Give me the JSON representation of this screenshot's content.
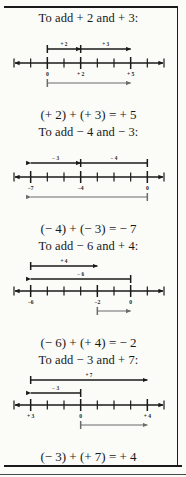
{
  "page": {
    "background_color": "#fbfbf8",
    "ink_color": "#1a1a1a",
    "result_arrow_color": "#6b6b6b"
  },
  "sections": [
    {
      "id": "add-plus2-plus3",
      "heading": "To add + 2 and + 3:",
      "equation": "(+ 2) + (+ 3) = + 5",
      "first_term_label": "+ 2",
      "second_term_label": "+ 3",
      "tick_labels": [
        "0",
        "+ 2",
        "+ 5"
      ],
      "tick_label_positions": [
        0,
        2,
        5
      ],
      "axis_min": -2,
      "axis_max": 7,
      "first_arrow": {
        "from": 0,
        "to": 2,
        "direction": "right"
      },
      "second_arrow": {
        "from": 2,
        "to": 5,
        "direction": "right"
      },
      "result_arrow": {
        "from": 0,
        "to": 5,
        "direction": "right",
        "below": true
      }
    },
    {
      "id": "add-minus4-minus3",
      "heading": "To add − 4 and − 3:",
      "equation": "(− 4) + (− 3) = − 7",
      "first_term_label": "− 3",
      "second_term_label": "− 4",
      "tick_labels": [
        "−7",
        "−4",
        "0"
      ],
      "tick_label_positions": [
        -7,
        -4,
        0
      ],
      "axis_min": -8,
      "axis_max": 1,
      "first_arrow": {
        "from": -4,
        "to": -7,
        "direction": "left"
      },
      "second_arrow": {
        "from": 0,
        "to": -4,
        "direction": "left"
      },
      "result_arrow": {
        "from": 0,
        "to": -7,
        "direction": "left",
        "below": true
      }
    },
    {
      "id": "add-minus6-plus4",
      "heading": "To add − 6 and + 4:",
      "equation": "(− 6) + (+ 4) = − 2",
      "first_term_label": "+ 4",
      "second_term_label": "− 6",
      "tick_labels": [
        "−6",
        "−2",
        "0"
      ],
      "tick_label_positions": [
        -6,
        -2,
        0
      ],
      "axis_min": -7,
      "axis_max": 2,
      "first_arrow": {
        "from": -6,
        "to": -2,
        "direction": "right"
      },
      "second_arrow": {
        "from": 0,
        "to": -6,
        "direction": "left"
      },
      "result_arrow": {
        "from": -2,
        "to": 0,
        "direction": "right",
        "below": true
      }
    },
    {
      "id": "add-minus3-plus7",
      "heading": "To add − 3 and + 7:",
      "equation": "(− 3) + (+ 7) = + 4",
      "first_term_label": "+ 7",
      "second_term_label": "− 3",
      "tick_labels": [
        "+ 3",
        "0",
        "+ 4"
      ],
      "tick_label_positions": [
        -3,
        0,
        4
      ],
      "axis_min": -4,
      "axis_max": 5,
      "first_arrow": {
        "from": -3,
        "to": 4,
        "direction": "right"
      },
      "second_arrow": {
        "from": 0,
        "to": -3,
        "direction": "left"
      },
      "result_arrow": {
        "from": 0,
        "to": 4,
        "direction": "right",
        "below": true
      }
    }
  ]
}
